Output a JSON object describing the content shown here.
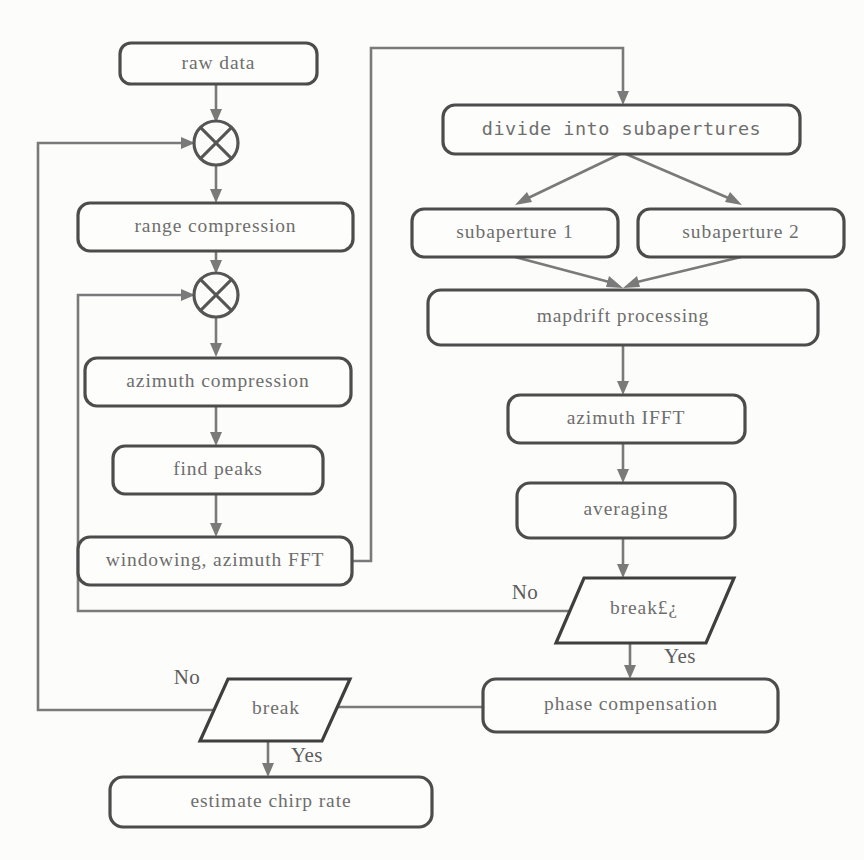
{
  "diagram": {
    "type": "flowchart",
    "colors": {
      "background": "#fcfcfa",
      "node_fill": "#fdfdfb",
      "node_stroke": "#4c4c4c",
      "edge_stroke": "#7a7a7a",
      "text": "#6e6e6e",
      "branch_text": "#5d5d5d"
    },
    "nodes": [
      {
        "id": "raw_data",
        "label": "raw data",
        "shape": "rounded-rect",
        "x": 120,
        "y": 43,
        "w": 197,
        "h": 41
      },
      {
        "id": "mult1",
        "label": "⊗",
        "shape": "circle-cross",
        "cx": 216,
        "cy": 143,
        "r": 22
      },
      {
        "id": "range_comp",
        "label": "range compression",
        "shape": "rounded-rect",
        "x": 78,
        "y": 203,
        "w": 275,
        "h": 48
      },
      {
        "id": "mult2",
        "label": "⊗",
        "shape": "circle-cross",
        "cx": 216,
        "cy": 295,
        "r": 22
      },
      {
        "id": "azimuth_comp",
        "label": "azimuth compression",
        "shape": "rounded-rect",
        "x": 85,
        "y": 358,
        "w": 266,
        "h": 48
      },
      {
        "id": "find_peaks",
        "label": "find peaks",
        "shape": "rounded-rect",
        "x": 113,
        "y": 446,
        "w": 210,
        "h": 48
      },
      {
        "id": "window_fft",
        "label": "windowing, azimuth FFT",
        "shape": "rounded-rect",
        "x": 78,
        "y": 537,
        "w": 274,
        "h": 48
      },
      {
        "id": "divide_sub",
        "label": "divide into subapertures",
        "shape": "rounded-rect",
        "x": 443,
        "y": 105,
        "w": 357,
        "h": 49
      },
      {
        "id": "subaperture1",
        "label": "subaperture 1",
        "shape": "rounded-rect",
        "x": 412,
        "y": 209,
        "w": 206,
        "h": 48
      },
      {
        "id": "subaperture2",
        "label": "subaperture 2",
        "shape": "rounded-rect",
        "x": 638,
        "y": 209,
        "w": 206,
        "h": 48
      },
      {
        "id": "mapdrift",
        "label": "mapdrift processing",
        "shape": "rounded-rect",
        "x": 428,
        "y": 290,
        "w": 390,
        "h": 55
      },
      {
        "id": "azimuth_ifft",
        "label": "azimuth IFFT",
        "shape": "rounded-rect",
        "x": 508,
        "y": 395,
        "w": 237,
        "h": 48
      },
      {
        "id": "averaging",
        "label": "averaging",
        "shape": "rounded-rect",
        "x": 517,
        "y": 483,
        "w": 218,
        "h": 55
      },
      {
        "id": "break_inner",
        "label": "break£¿",
        "shape": "parallelogram",
        "x": 556,
        "y": 578,
        "w": 150,
        "h": 65,
        "skew": 28
      },
      {
        "id": "phase_comp",
        "label": "phase compensation",
        "shape": "rounded-rect",
        "x": 483,
        "y": 679,
        "w": 295,
        "h": 53
      },
      {
        "id": "break_outer",
        "label": "break",
        "shape": "parallelogram",
        "x": 200,
        "y": 679,
        "w": 150,
        "h": 62,
        "skew": 28
      },
      {
        "id": "estimate_chirp",
        "label": "estimate chirp rate",
        "shape": "rounded-rect",
        "x": 110,
        "y": 777,
        "w": 322,
        "h": 50
      }
    ],
    "branch_labels": [
      {
        "id": "no_inner",
        "text": "No",
        "x": 525,
        "y": 594
      },
      {
        "id": "yes_inner",
        "text": "Yes",
        "x": 680,
        "y": 658
      },
      {
        "id": "no_outer",
        "text": "No",
        "x": 187,
        "y": 679
      },
      {
        "id": "yes_outer",
        "text": "Yes",
        "x": 307,
        "y": 757
      }
    ],
    "edges": [
      {
        "from": "raw_data",
        "to": "mult1",
        "kind": "straight-down",
        "label": ""
      },
      {
        "from": "mult1",
        "to": "range_comp",
        "kind": "straight-down",
        "label": ""
      },
      {
        "from": "range_comp",
        "to": "mult2",
        "kind": "straight-down",
        "label": ""
      },
      {
        "from": "mult2",
        "to": "azimuth_comp",
        "kind": "straight-down",
        "label": ""
      },
      {
        "from": "azimuth_comp",
        "to": "find_peaks",
        "kind": "straight-down",
        "label": ""
      },
      {
        "from": "find_peaks",
        "to": "window_fft",
        "kind": "straight-down",
        "label": ""
      },
      {
        "from": "window_fft",
        "to": "divide_sub",
        "kind": "route-right-up-right-down",
        "label": ""
      },
      {
        "from": "divide_sub",
        "to": "subaperture1",
        "kind": "diagonal",
        "label": ""
      },
      {
        "from": "divide_sub",
        "to": "subaperture2",
        "kind": "diagonal",
        "label": ""
      },
      {
        "from": "subaperture1",
        "to": "mapdrift",
        "kind": "diagonal",
        "label": ""
      },
      {
        "from": "subaperture2",
        "to": "mapdrift",
        "kind": "diagonal",
        "label": ""
      },
      {
        "from": "mapdrift",
        "to": "azimuth_ifft",
        "kind": "straight-down",
        "label": ""
      },
      {
        "from": "azimuth_ifft",
        "to": "averaging",
        "kind": "straight-down",
        "label": ""
      },
      {
        "from": "averaging",
        "to": "break_inner",
        "kind": "straight-down",
        "label": ""
      },
      {
        "from": "break_inner",
        "to": "mult2",
        "kind": "feedback-inner",
        "label": "No"
      },
      {
        "from": "break_inner",
        "to": "phase_comp",
        "kind": "straight-down",
        "label": "Yes"
      },
      {
        "from": "phase_comp",
        "to": "break_outer",
        "kind": "straight-left",
        "label": ""
      },
      {
        "from": "break_outer",
        "to": "mult1",
        "kind": "feedback-outer",
        "label": "No"
      },
      {
        "from": "break_outer",
        "to": "estimate_chirp",
        "kind": "straight-down",
        "label": "Yes"
      }
    ]
  }
}
